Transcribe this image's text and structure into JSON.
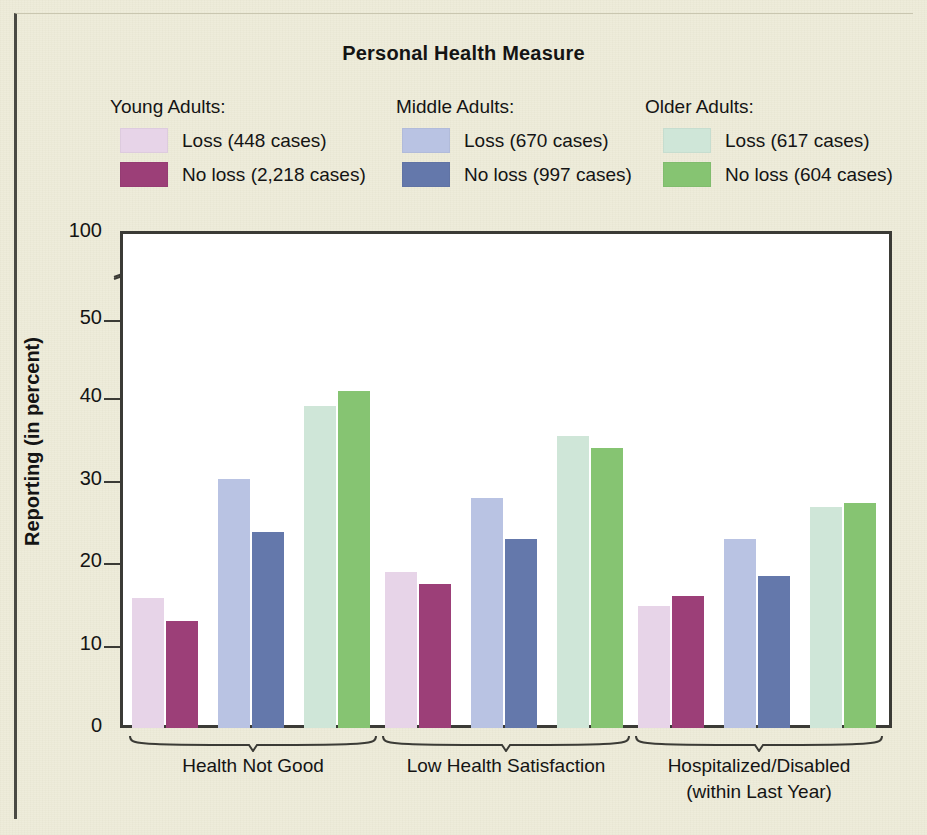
{
  "chart_data": {
    "type": "bar",
    "title": "Personal Health Measure",
    "xlabel": "",
    "ylabel": "Reporting (in percent)",
    "ylim": [
      0,
      100
    ],
    "yticks": [
      0,
      10,
      20,
      30,
      40,
      50,
      100
    ],
    "axis_break": "between 50 and 100",
    "grid": false,
    "legend_position": "top",
    "categories": [
      "Health Not Good",
      "Low Health Satisfaction",
      "Hospitalized/Disabled\n(within Last Year)"
    ],
    "category_lines": [
      [
        "Health Not Good"
      ],
      [
        "Low Health Satisfaction"
      ],
      [
        "Hospitalized/Disabled",
        "(within Last Year)"
      ]
    ],
    "series": [
      {
        "name": "Young Adults: Loss (448 cases)",
        "group": "Young Adults",
        "condition": "Loss",
        "cases": "448",
        "color": "#e7d4e8",
        "values": [
          15.8,
          18.9,
          14.8
        ]
      },
      {
        "name": "Young Adults: No loss (2,218 cases)",
        "group": "Young Adults",
        "condition": "No loss",
        "cases": "2,218",
        "color": "#9c3f78",
        "values": [
          13.0,
          17.4,
          16.0
        ]
      },
      {
        "name": "Middle Adults: Loss (670 cases)",
        "group": "Middle Adults",
        "condition": "Loss",
        "cases": "670",
        "color": "#b9c3e3",
        "values": [
          30.2,
          27.9,
          22.9
        ]
      },
      {
        "name": "Middle Adults: No loss (997 cases)",
        "group": "Middle Adults",
        "condition": "No loss",
        "cases": "997",
        "color": "#6478ab",
        "values": [
          23.7,
          22.9,
          18.4
        ]
      },
      {
        "name": "Older Adults: Loss (617 cases)",
        "group": "Older Adults",
        "condition": "Loss",
        "cases": "617",
        "color": "#cfe6d8",
        "values": [
          39.0,
          35.4,
          26.8
        ]
      },
      {
        "name": "Older Adults: No loss (604 cases)",
        "group": "Older Adults",
        "condition": "No loss",
        "cases": "604",
        "color": "#86c472",
        "values": [
          40.9,
          33.9,
          27.3
        ]
      }
    ]
  },
  "title": "Personal Health Measure",
  "yaxis": {
    "title": "Reporting (in percent)",
    "ticks": [
      "100",
      "50",
      "40",
      "30",
      "20",
      "10",
      "0"
    ]
  },
  "legend": {
    "young": {
      "heading": "Young Adults:",
      "rows": [
        {
          "label": "Loss (448 cases)",
          "color": "#e7d4e8"
        },
        {
          "label": "No loss (2,218 cases)",
          "color": "#9c3f78"
        }
      ]
    },
    "middle": {
      "heading": "Middle Adults:",
      "rows": [
        {
          "label": "Loss (670 cases)",
          "color": "#b9c3e3"
        },
        {
          "label": "No loss (997 cases)",
          "color": "#6478ab"
        }
      ]
    },
    "older": {
      "heading": "Older Adults:",
      "rows": [
        {
          "label": "Loss (617 cases)",
          "color": "#cfe6d8"
        },
        {
          "label": "No loss (604 cases)",
          "color": "#86c472"
        }
      ]
    }
  },
  "xaxis": {
    "labels": [
      {
        "line1": "Health Not Good",
        "line2": ""
      },
      {
        "line1": "Low Health Satisfaction",
        "line2": ""
      },
      {
        "line1": "Hospitalized/Disabled",
        "line2": "(within Last Year)"
      }
    ]
  }
}
